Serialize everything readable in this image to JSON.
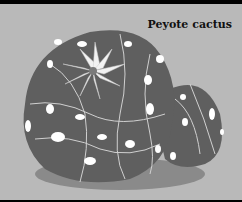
{
  "caption": "Peyote cactus",
  "colors": {
    "background": "#b9b9b9",
    "frame": "#000000",
    "cactus_body": "#5f5f5f",
    "shadow": "#8a8a8a",
    "ribs": "#d0d0d0",
    "tufts": "#ffffff"
  }
}
